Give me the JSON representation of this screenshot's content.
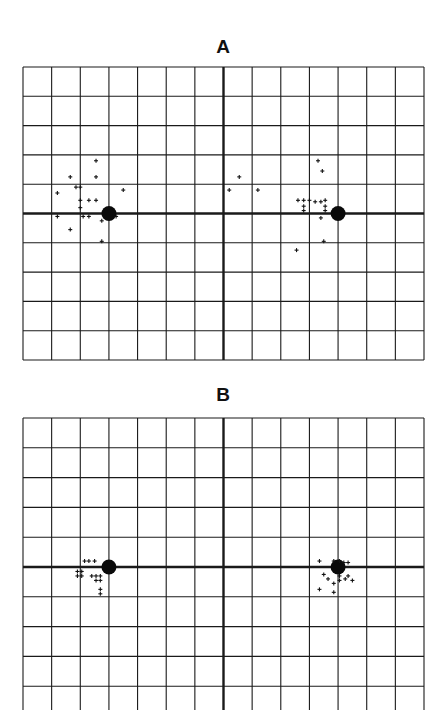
{
  "chart_data": [
    {
      "type": "scatter",
      "title": "A",
      "grid": true,
      "grid_columns": 14,
      "grid_rows": 10,
      "xlim": [
        -7,
        7
      ],
      "ylim": [
        -5,
        5
      ],
      "xlabel": "",
      "ylabel": "",
      "reference_points": [
        {
          "x": -4,
          "y": 0,
          "marker": "filled-circle"
        },
        {
          "x": 4,
          "y": 0,
          "marker": "filled-circle"
        }
      ],
      "series": [
        {
          "name": "responses",
          "marker": "+",
          "points": [
            [
              -5.35,
              1.25
            ],
            [
              -5.15,
              0.9
            ],
            [
              -5.0,
              0.9
            ],
            [
              -5.0,
              0.45
            ],
            [
              -5.0,
              0.2
            ],
            [
              -5.8,
              0.7
            ],
            [
              -5.8,
              -0.1
            ],
            [
              -4.45,
              1.8
            ],
            [
              -4.45,
              1.25
            ],
            [
              -4.45,
              0.45
            ],
            [
              -4.7,
              0.45
            ],
            [
              -3.5,
              0.8
            ],
            [
              -4.25,
              -0.25
            ],
            [
              -4.7,
              -0.1
            ],
            [
              -4.9,
              -0.1
            ],
            [
              -5.35,
              -0.55
            ],
            [
              -3.75,
              -0.1
            ],
            [
              -4.25,
              -0.95
            ]
          ]
        },
        {
          "name": "responses-right",
          "marker": "+",
          "points": [
            [
              0.55,
              1.25
            ],
            [
              0.2,
              0.8
            ],
            [
              1.2,
              0.8
            ],
            [
              2.8,
              0.45
            ],
            [
              3.0,
              0.45
            ],
            [
              2.6,
              0.45
            ],
            [
              2.8,
              0.25
            ],
            [
              2.8,
              0.1
            ],
            [
              3.4,
              0.4
            ],
            [
              3.55,
              0.45
            ],
            [
              3.2,
              0.4
            ],
            [
              3.55,
              0.25
            ],
            [
              3.55,
              0.1
            ],
            [
              3.4,
              -0.15
            ],
            [
              3.3,
              1.8
            ],
            [
              3.45,
              1.45
            ],
            [
              2.55,
              -1.25
            ],
            [
              3.5,
              -0.95
            ]
          ]
        }
      ]
    },
    {
      "type": "scatter",
      "title": "B",
      "grid": true,
      "grid_columns": 14,
      "grid_rows": 10,
      "xlim": [
        -7,
        7
      ],
      "ylim": [
        -5,
        5
      ],
      "xlabel": "",
      "ylabel": "",
      "reference_points": [
        {
          "x": -4,
          "y": 0,
          "marker": "filled-circle"
        },
        {
          "x": 4,
          "y": 0,
          "marker": "filled-circle"
        }
      ],
      "series": [
        {
          "name": "responses",
          "marker": "+",
          "points": [
            [
              -4.85,
              0.2
            ],
            [
              -4.7,
              0.2
            ],
            [
              -4.5,
              0.2
            ],
            [
              -5.1,
              -0.15
            ],
            [
              -5.1,
              -0.3
            ],
            [
              -4.95,
              -0.15
            ],
            [
              -4.95,
              -0.3
            ],
            [
              -4.6,
              -0.3
            ],
            [
              -4.45,
              -0.3
            ],
            [
              -4.3,
              -0.3
            ],
            [
              -4.45,
              -0.45
            ],
            [
              -4.3,
              -0.45
            ],
            [
              -4.3,
              -0.75
            ],
            [
              -4.3,
              -0.9
            ]
          ]
        },
        {
          "name": "responses-right",
          "marker": "+",
          "points": [
            [
              3.35,
              0.2
            ],
            [
              3.85,
              0.2
            ],
            [
              4.05,
              0.2
            ],
            [
              4.2,
              0.15
            ],
            [
              4.35,
              0.15
            ],
            [
              3.5,
              -0.25
            ],
            [
              3.65,
              -0.4
            ],
            [
              3.85,
              -0.55
            ],
            [
              3.85,
              -0.85
            ],
            [
              3.35,
              -0.75
            ],
            [
              4.05,
              -0.3
            ],
            [
              4.05,
              -0.45
            ],
            [
              4.25,
              -0.4
            ],
            [
              4.35,
              -0.3
            ],
            [
              4.5,
              -0.45
            ]
          ]
        }
      ]
    }
  ],
  "panels": {
    "a": {
      "title": "A"
    },
    "b": {
      "title": "B"
    }
  }
}
